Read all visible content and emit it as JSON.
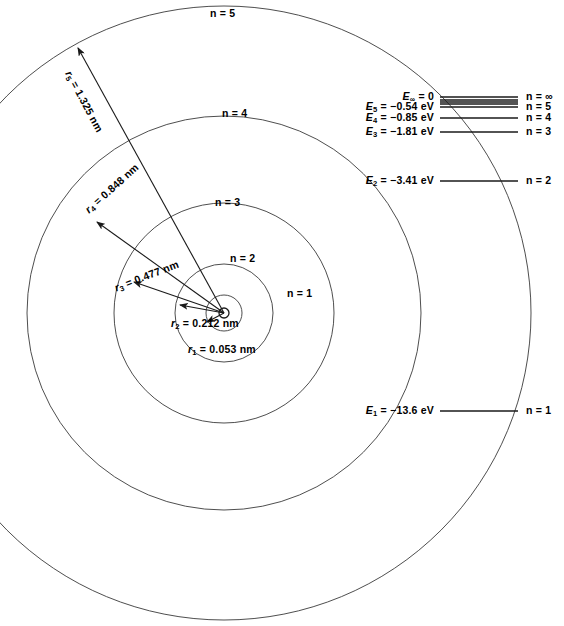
{
  "figure": {
    "type": "bohr-model-diagram",
    "background_color": "#ffffff",
    "line_color": "#1a1a1a"
  },
  "atom": {
    "nucleus_label": "",
    "center_x": 224,
    "center_y": 313,
    "nucleus_radius_px": 5,
    "orbits": [
      {
        "n": 1,
        "label": "n = 1",
        "radius_px": 18,
        "label_x": 287,
        "label_y": 288
      },
      {
        "n": 2,
        "label": "n = 2",
        "radius_px": 49,
        "label_x": 230,
        "label_y": 253
      },
      {
        "n": 3,
        "label": "n = 3",
        "radius_px": 110,
        "label_x": 215,
        "label_y": 197
      },
      {
        "n": 4,
        "label": "n = 4",
        "radius_px": 197,
        "label_x": 222,
        "label_y": 108
      },
      {
        "n": 5,
        "label": "n = 5",
        "radius_px": 307,
        "label_x": 210,
        "label_y": 8
      }
    ]
  },
  "radii": [
    {
      "n": 1,
      "label": "r₁ = 0.053 nm",
      "symbol": "r",
      "sub": "1",
      "value": "0.053",
      "unit": "nm",
      "tip_x": 207,
      "tip_y": 322,
      "text_x": 188,
      "text_y": 344,
      "rotation_deg": 0
    },
    {
      "n": 2,
      "label": "r₂ = 0.212 nm",
      "symbol": "r",
      "sub": "2",
      "value": "0.212",
      "unit": "nm",
      "tip_x": 180,
      "tip_y": 305,
      "text_x": 171,
      "text_y": 318,
      "rotation_deg": 0
    },
    {
      "n": 3,
      "label": "r₃ = 0.477 nm",
      "symbol": "r",
      "sub": "3",
      "value": "0.477",
      "unit": "nm",
      "tip_x": 134,
      "tip_y": 282,
      "text_x": 113,
      "text_y": 283,
      "rotation_deg": -21
    },
    {
      "n": 4,
      "label": "r₄ = 0.848 nm",
      "symbol": "r",
      "sub": "4",
      "value": "0.848",
      "unit": "nm",
      "tip_x": 97,
      "tip_y": 222,
      "text_x": 83,
      "text_y": 207,
      "rotation_deg": -42
    },
    {
      "n": 5,
      "label": "r₅ = 1.325 nm",
      "symbol": "r",
      "sub": "5",
      "value": "1.325",
      "unit": "nm",
      "tip_x": 78,
      "tip_y": 48,
      "text_x": 73,
      "text_y": 69,
      "rotation_deg": 62
    }
  ],
  "energy_diagram": {
    "line_x_start": 440,
    "line_x_end": 518,
    "levels": [
      {
        "key": "inf",
        "energy_label": "E∞ = 0",
        "n_label": "n = ∞",
        "y": 97,
        "sym": "E",
        "sub": "∞",
        "value": "0",
        "unit": ""
      },
      {
        "key": "6",
        "energy_label": "",
        "n_label": "",
        "y": 100,
        "sym": "",
        "sub": "",
        "value": "",
        "unit": ""
      },
      {
        "key": "7",
        "energy_label": "",
        "n_label": "",
        "y": 102,
        "sym": "",
        "sub": "",
        "value": "",
        "unit": ""
      },
      {
        "key": "8",
        "energy_label": "",
        "n_label": "",
        "y": 104,
        "sym": "",
        "sub": "",
        "value": "",
        "unit": ""
      },
      {
        "key": "5",
        "energy_label": "E₅ = −0.54 eV",
        "n_label": "n = 5",
        "y": 107,
        "sym": "E",
        "sub": "5",
        "value": "−0.54",
        "unit": "eV"
      },
      {
        "key": "4",
        "energy_label": "E₄ = −0.85 eV",
        "n_label": "n = 4",
        "y": 118,
        "sym": "E",
        "sub": "4",
        "value": "−0.85",
        "unit": "eV"
      },
      {
        "key": "3",
        "energy_label": "E₃ = −1.81 eV",
        "n_label": "n = 3",
        "y": 132,
        "sym": "E",
        "sub": "3",
        "value": "−1.81",
        "unit": "eV"
      },
      {
        "key": "2",
        "energy_label": "E₂ = −3.41 eV",
        "n_label": "n = 2",
        "y": 181,
        "sym": "E",
        "sub": "2",
        "value": "−3.41",
        "unit": "eV"
      },
      {
        "key": "1",
        "energy_label": "E₁ = −13.6 eV",
        "n_label": "n = 1",
        "y": 411,
        "sym": "E",
        "sub": "1",
        "value": "−13.6",
        "unit": "eV"
      }
    ]
  },
  "chart_data": {
    "type": "diagram",
    "orbit_radii_nm": {
      "categories": [
        "n = 1",
        "n = 2",
        "n = 3",
        "n = 4",
        "n = 5"
      ],
      "values": [
        0.053,
        0.212,
        0.477,
        0.848,
        1.325
      ],
      "unit": "nm"
    },
    "energy_levels_eV": {
      "categories": [
        "n = 1",
        "n = 2",
        "n = 3",
        "n = 4",
        "n = 5",
        "n = ∞"
      ],
      "values": [
        -13.6,
        -3.41,
        -1.81,
        -0.85,
        -0.54,
        0
      ],
      "unit": "eV"
    },
    "xlabel": "",
    "ylabel": "Energy (eV)",
    "grid": false,
    "legend": "none"
  }
}
